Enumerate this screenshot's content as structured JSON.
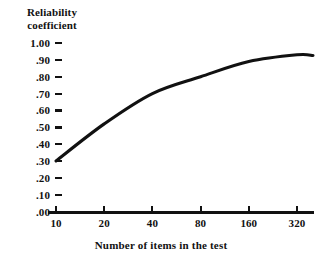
{
  "chart_data": {
    "type": "line",
    "title": "",
    "xlabel": "Number of items in the test",
    "ylabel": "Reliability coefficient",
    "ylabel_lines": [
      "Reliability",
      "coefficient"
    ],
    "x_scale": "log2",
    "x": [
      10,
      20,
      40,
      80,
      160,
      320
    ],
    "xticklabels": [
      "10",
      "20",
      "40",
      "80",
      "160",
      "320"
    ],
    "yticklabels": [
      "1.00",
      ".90",
      ".80",
      ".70",
      ".60",
      ".50",
      ".40",
      ".30",
      ".20",
      ".10",
      ".00"
    ],
    "yticks": [
      1.0,
      0.9,
      0.8,
      0.7,
      0.6,
      0.5,
      0.4,
      0.3,
      0.2,
      0.1,
      0.0
    ],
    "ylim": [
      0.0,
      1.0
    ],
    "grid": false,
    "legend": null,
    "series": [
      {
        "name": "Reliability coefficient",
        "values": [
          0.3,
          0.52,
          0.7,
          0.8,
          0.89,
          0.93
        ],
        "color": "#111111"
      }
    ]
  }
}
